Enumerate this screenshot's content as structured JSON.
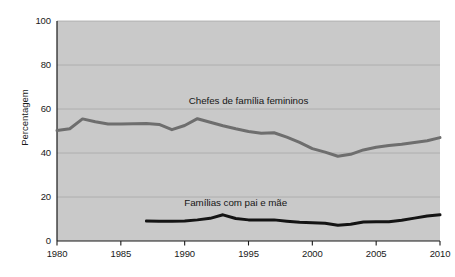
{
  "chart_data": {
    "type": "line",
    "title": "",
    "subtitle": "",
    "xlabel": "",
    "ylabel": "Percentagem",
    "xlim": [
      1980,
      2010
    ],
    "ylim": [
      0,
      100
    ],
    "grid": true,
    "grid_axis": "y",
    "legend_position": "inline-annotation",
    "plot_background_color": "#c9c9c9",
    "x_ticks": [
      1980,
      1985,
      1990,
      1995,
      2000,
      2005,
      2010
    ],
    "x_tick_labels": [
      "1980",
      "1985",
      "1990",
      "1995",
      "2000",
      "2005",
      "2010"
    ],
    "y_ticks": [
      0,
      20,
      40,
      60,
      80,
      100
    ],
    "y_tick_labels": [
      "0",
      "20",
      "40",
      "60",
      "80",
      "100"
    ],
    "series": [
      {
        "name": "Chefes de família femininos",
        "color": "#6e6e6e",
        "line_width": 3,
        "label_x": 1995.0,
        "label_y": 63,
        "x": [
          1980,
          1981,
          1982,
          1983,
          1984,
          1985,
          1986,
          1987,
          1988,
          1989,
          1990,
          1991,
          1992,
          1993,
          1994,
          1995,
          1996,
          1997,
          1998,
          1999,
          2000,
          2001,
          2002,
          2003,
          2004,
          2005,
          2006,
          2007,
          2008,
          2009,
          2010
        ],
        "values": [
          50.2,
          51.0,
          55.5,
          54.2,
          53.2,
          53.2,
          53.3,
          53.4,
          53.0,
          50.6,
          52.5,
          55.6,
          54.0,
          52.4,
          51.0,
          49.8,
          49.0,
          49.2,
          47.2,
          44.8,
          42.0,
          40.4,
          38.5,
          39.4,
          41.4,
          42.6,
          43.4,
          44.0,
          44.8,
          45.6,
          47.0
        ]
      },
      {
        "name": "Famílias com pai e mãe",
        "color": "#141414",
        "line_width": 3,
        "label_x": 1994.0,
        "label_y": 17,
        "x": [
          1987,
          1988,
          1989,
          1990,
          1991,
          1992,
          1993,
          1994,
          1995,
          1996,
          1997,
          1998,
          1999,
          2000,
          2001,
          2002,
          2003,
          2004,
          2005,
          2006,
          2007,
          2008,
          2009,
          2010
        ],
        "values": [
          9.1,
          9.0,
          9.0,
          9.1,
          9.6,
          10.3,
          11.9,
          10.2,
          9.6,
          9.6,
          9.6,
          9.0,
          8.5,
          8.3,
          8.1,
          7.2,
          7.6,
          8.6,
          8.8,
          8.8,
          9.4,
          10.4,
          11.4,
          11.9
        ]
      }
    ],
    "annotations": [
      {
        "text": "Chefes de família femininos",
        "x": 1995.0,
        "y": 63
      },
      {
        "text": "Famílias com pai e mãe",
        "x": 1994.0,
        "y": 17
      }
    ]
  }
}
